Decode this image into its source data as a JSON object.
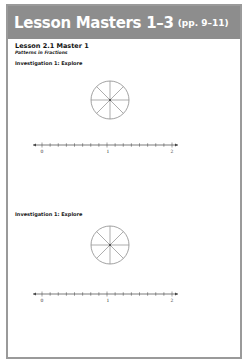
{
  "header": {
    "title": "Lesson Masters 1–3",
    "pages": "(pp. 9–11)",
    "band_color": "#8d8d8d",
    "text_color": "#ffffff"
  },
  "lesson": {
    "title": "Lesson 2.1 Master 1",
    "subtitle": "Patterns in Fractions"
  },
  "sections": [
    {
      "heading": "Investigation 1: Explore",
      "circle": {
        "cx": 110,
        "cy": 100,
        "r": 19,
        "divisions": 8
      },
      "number_line": {
        "y": 145,
        "x_start": 33,
        "x_end": 178,
        "labels": [
          "0",
          "1",
          "2"
        ],
        "label_x": [
          42,
          108,
          172
        ],
        "ticks_per_unit": 8
      }
    },
    {
      "heading": "Investigation 1: Explore",
      "circle": {
        "cx": 110,
        "cy": 245,
        "r": 19,
        "divisions": 8
      },
      "number_line": {
        "y": 294,
        "x_start": 33,
        "x_end": 178,
        "labels": [
          "0",
          "1",
          "2"
        ],
        "label_x": [
          42,
          108,
          172
        ],
        "ticks_per_unit": 8
      }
    }
  ]
}
